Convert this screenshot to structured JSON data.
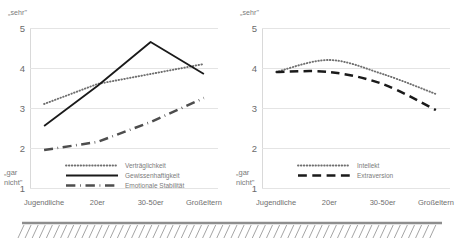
{
  "chart_data": [
    {
      "type": "line",
      "panel": "left",
      "title": "",
      "xlabel": "",
      "ylabel": "",
      "categories": [
        "Jugendliche",
        "20er",
        "30-50er",
        "Großeltern"
      ],
      "ylim": [
        1,
        5
      ],
      "yticks": [
        5,
        4,
        3,
        2,
        1
      ],
      "axis_top_label": "„sehr\"",
      "axis_bottom_label": "„gar nicht\"",
      "grid": true,
      "legend_position": "inside-bottom",
      "series": [
        {
          "name": "Verträglichkeit",
          "style": "dotted",
          "color": "#6f6f6f",
          "values": [
            3.1,
            3.6,
            3.85,
            4.1
          ]
        },
        {
          "name": "Gewissenhaftigkeit",
          "style": "solid",
          "color": "#1a1a1a",
          "values": [
            2.55,
            3.55,
            4.65,
            3.85
          ]
        },
        {
          "name": "Emotionale Stabilität",
          "style": "dashdot",
          "color": "#4d4d4d",
          "values": [
            1.95,
            2.15,
            2.65,
            3.25
          ]
        }
      ]
    },
    {
      "type": "line",
      "panel": "right",
      "title": "",
      "xlabel": "",
      "ylabel": "",
      "categories": [
        "Jugendliche",
        "20er",
        "30-50er",
        "Großeltern"
      ],
      "ylim": [
        1,
        5
      ],
      "yticks": [
        5,
        4,
        3,
        2,
        1
      ],
      "axis_top_label": "„sehr\"",
      "axis_bottom_label": "„gar nicht\"",
      "grid": true,
      "legend_position": "inside-bottom",
      "series": [
        {
          "name": "Intellekt",
          "style": "dotted",
          "color": "#6f6f6f",
          "values": [
            3.9,
            4.2,
            3.85,
            3.35
          ]
        },
        {
          "name": "Extraversion",
          "style": "dashed",
          "color": "#1a1a1a",
          "values": [
            3.9,
            3.9,
            3.6,
            2.95
          ]
        }
      ]
    }
  ],
  "left": {
    "anchor_top": "„sehr\"",
    "anchor_bottom_line1": "„gar",
    "anchor_bottom_line2": "nicht\"",
    "yticks": [
      "5",
      "4",
      "3",
      "2",
      "1"
    ],
    "categories": [
      "Jugendliche",
      "20er",
      "30-50er",
      "Großeltern"
    ],
    "legend": [
      "Verträglichkeit",
      "Gewissenhaftigkeit",
      "Emotionale Stabilität"
    ]
  },
  "right": {
    "anchor_top": "„sehr\"",
    "anchor_bottom_line1": "„gar",
    "anchor_bottom_line2": "nicht\"",
    "yticks": [
      "5",
      "4",
      "3",
      "2",
      "1"
    ],
    "categories": [
      "Jugendliche",
      "20er",
      "30-50er",
      "Großeltern"
    ],
    "legend": [
      "Intellekt",
      "Extraversion"
    ]
  }
}
